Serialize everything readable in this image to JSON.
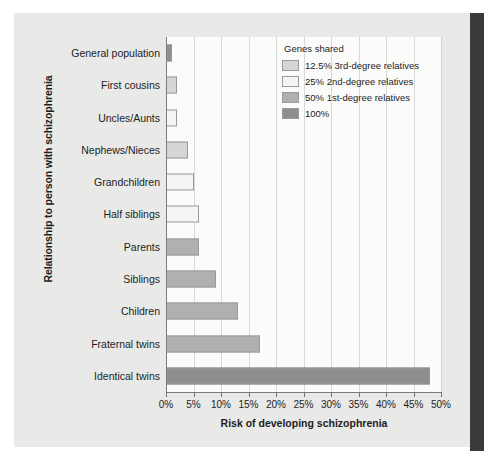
{
  "chart_data": {
    "type": "bar",
    "orientation": "horizontal",
    "title": "",
    "xlabel": "Risk of developing schizophrenia",
    "ylabel": "Relationship to person with schizophrenia",
    "xlim": [
      0,
      50
    ],
    "xtick_labels": [
      "0%",
      "5%",
      "10%",
      "15%",
      "20%",
      "25%",
      "30%",
      "35%",
      "40%",
      "45%",
      "50%"
    ],
    "xtick_values": [
      0,
      5,
      10,
      15,
      20,
      25,
      30,
      35,
      40,
      45,
      50
    ],
    "grid": true,
    "legend_position": "top-right",
    "categories": [
      "General population",
      "First cousins",
      "Uncles/Aunts",
      "Nephews/Nieces",
      "Grandchildren",
      "Half siblings",
      "Parents",
      "Siblings",
      "Children",
      "Fraternal twins",
      "Identical twins"
    ],
    "values": [
      1,
      2,
      2,
      4,
      5,
      6,
      6,
      9,
      13,
      17,
      48
    ],
    "group_keys": [
      "100",
      "12.5",
      "25",
      "12.5",
      "25",
      "25",
      "50",
      "50",
      "50",
      "50",
      "100"
    ]
  },
  "legend": {
    "title": "Genes shared",
    "items": [
      {
        "label": "12.5% 3rd-degree relatives",
        "key": "12.5",
        "color": "#d6d6d4"
      },
      {
        "label": "25% 2nd-degree relatives",
        "key": "25",
        "color": "#f4f4f2"
      },
      {
        "label": "50% 1st-degree relatives",
        "key": "50",
        "color": "#b0b0ae"
      },
      {
        "label": "100%",
        "key": "100",
        "color": "#8e8e8c"
      }
    ]
  },
  "colors": {
    "paper": "#e9e9e7",
    "plot_background": "#fbfbfa",
    "axis": "#7c7c7c",
    "gridline": "#d8d8d6",
    "bar_border": "#9a9a98",
    "text": "#1d1d1d",
    "binding_band": "#3a3a3a"
  }
}
